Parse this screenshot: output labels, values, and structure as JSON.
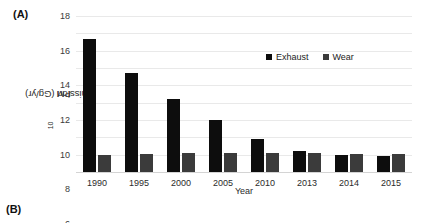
{
  "panels": {
    "a_label": "(A)",
    "b_label": "(B)"
  },
  "chart_data": {
    "type": "bar",
    "title": "",
    "xlabel": "Year",
    "ylabel": "PM10 emission (Gg/yr)",
    "ylabel_prefix": "PM",
    "ylabel_sub": "10",
    "ylabel_suffix": " emission (Gg/yr)",
    "categories": [
      "1990",
      "1995",
      "2000",
      "2005",
      "2010",
      "2013",
      "2014",
      "2015"
    ],
    "series": [
      {
        "name": "Exhaust",
        "color": "#0d0d0d",
        "values": [
          15.3,
          11.4,
          8.4,
          6.0,
          3.8,
          2.45,
          2.0,
          1.8
        ]
      },
      {
        "name": "Wear",
        "color": "#3b3b3b",
        "values": [
          2.0,
          2.05,
          2.15,
          2.2,
          2.25,
          2.15,
          2.1,
          2.1
        ]
      }
    ],
    "ylim": [
      0,
      18
    ],
    "yticks": [
      0,
      2,
      4,
      6,
      8,
      10,
      12,
      14,
      16,
      18
    ],
    "grid": true,
    "legend_position": "inside-top-right"
  }
}
